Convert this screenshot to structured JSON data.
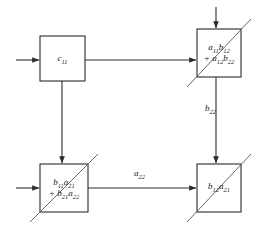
{
  "diagram": {
    "type": "systolic-array-dataflow",
    "background_color": "#ffffff",
    "line_color": "#2b2b2b",
    "diagonal_color": "#555555",
    "cells": [
      {
        "id": "cell-c11",
        "name": "cell-top-left",
        "lines": [
          "c",
          "11"
        ],
        "term1_base": "c",
        "term1_sub": "11",
        "term2_base": "",
        "term2_sub": "",
        "has_diagonal": false,
        "x": 40,
        "y": 36,
        "width": 45,
        "height": 45
      },
      {
        "id": "cell-a11b12",
        "name": "cell-top-right",
        "term1_base": "a",
        "term1_sub": "11",
        "term1_base2": "b",
        "term1_sub2": "12",
        "term2_base": "a",
        "term2_sub": "12",
        "term2_base2": "b",
        "term2_sub2": "22",
        "has_diagonal": true,
        "x": 197,
        "y": 29,
        "width": 44,
        "height": 48
      },
      {
        "id": "cell-b11a21",
        "name": "cell-bottom-left",
        "term1_base": "b",
        "term1_sub": "11",
        "term1_base2": "a",
        "term1_sub2": "21",
        "term2_base": "b",
        "term2_sub": "21",
        "term2_base2": "a",
        "term2_sub2": "22",
        "has_diagonal": true,
        "x": 40,
        "y": 164,
        "width": 48,
        "height": 48
      },
      {
        "id": "cell-b12a21",
        "name": "cell-bottom-right",
        "term1_base": "b",
        "term1_sub": "12",
        "term1_base2": "a",
        "term1_sub2": "21",
        "term2_base": "",
        "term2_sub": "",
        "has_diagonal": true,
        "x": 197,
        "y": 164,
        "width": 44,
        "height": 48
      }
    ],
    "edge_labels": [
      {
        "id": "label-b22",
        "base": "b",
        "sub": "22",
        "x": 205,
        "y": 108
      },
      {
        "id": "label-a22",
        "base": "a",
        "sub": "22",
        "x": 134,
        "y": 163
      }
    ],
    "plus_sign": "+",
    "arrows": [
      {
        "id": "arrow-in-top-left",
        "direction": "right"
      },
      {
        "id": "arrow-c11-to-top-right",
        "direction": "right"
      },
      {
        "id": "arrow-c11-to-bottom-left",
        "direction": "down"
      },
      {
        "id": "arrow-in-top-right",
        "direction": "down"
      },
      {
        "id": "arrow-top-right-to-bottom-right",
        "direction": "down"
      },
      {
        "id": "arrow-in-bottom-left",
        "direction": "right"
      },
      {
        "id": "arrow-bottom-left-to-bottom-right",
        "direction": "right"
      }
    ]
  }
}
